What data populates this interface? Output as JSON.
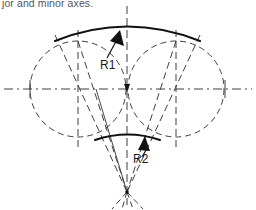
{
  "figure": {
    "caption_fragment": "jor and minor axes.",
    "colors": {
      "background": "#ffffff",
      "line": "#111111",
      "construction_line": "#4a4a4a",
      "caption_text": "#55555a"
    },
    "labels": {
      "radius_large": "R1",
      "radius_small": "R2"
    },
    "geometry": {
      "center_x": 127,
      "axis_y": 89,
      "left_circle_center_x": 78,
      "right_circle_center_x": 176,
      "circle_radius": 48,
      "left_axis_tick_x": 30,
      "right_axis_tick_x": 225,
      "major_arc_left_x": 55,
      "major_arc_right_x": 200,
      "major_arc_apex_y": 24,
      "minor_arc_left_x": 95,
      "minor_arc_right_x": 160,
      "minor_arc_apex_y": 133,
      "convergence_point_x": 127,
      "convergence_point_y": 192
    }
  }
}
